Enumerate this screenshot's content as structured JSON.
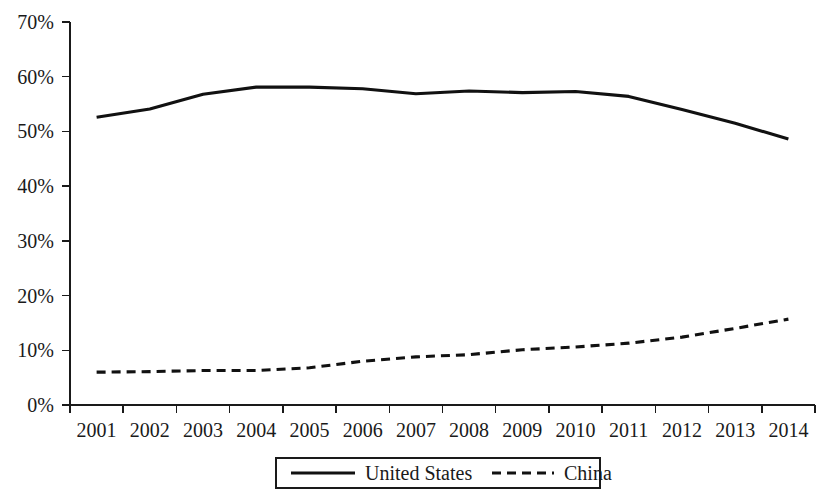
{
  "chart_data": {
    "type": "line",
    "title": "",
    "subtitle": "",
    "xlabel": "",
    "ylabel": "",
    "grid": false,
    "legend_position": "bottom",
    "x": [
      "2001",
      "2002",
      "2003",
      "2004",
      "2005",
      "2006",
      "2007",
      "2008",
      "2009",
      "2010",
      "2011",
      "2012",
      "2013",
      "2014"
    ],
    "categories": [
      "2001",
      "2002",
      "2003",
      "2004",
      "2005",
      "2006",
      "2007",
      "2008",
      "2009",
      "2010",
      "2011",
      "2012",
      "2013",
      "2014"
    ],
    "ylim": [
      0,
      70
    ],
    "y_ticks": [
      0,
      10,
      20,
      30,
      40,
      50,
      60,
      70
    ],
    "y_tick_labels": [
      "0%",
      "10%",
      "20%",
      "30%",
      "40%",
      "50%",
      "60%",
      "70%"
    ],
    "y_unit": "%",
    "series": [
      {
        "name": "United States",
        "style": "solid",
        "color": "#111111",
        "values": [
          52.6,
          54.1,
          56.8,
          58.1,
          58.1,
          57.8,
          56.9,
          57.4,
          57.1,
          57.3,
          56.4,
          54.0,
          51.5,
          48.6
        ]
      },
      {
        "name": "China",
        "style": "dashed",
        "color": "#111111",
        "values": [
          6.0,
          6.1,
          6.3,
          6.3,
          6.8,
          8.0,
          8.8,
          9.2,
          10.1,
          10.6,
          11.3,
          12.4,
          14.0,
          15.7
        ]
      }
    ]
  },
  "axes": {
    "y_tick_labels": [
      "70%",
      "60%",
      "50%",
      "40%",
      "30%",
      "20%",
      "10%",
      "0%"
    ],
    "x_tick_labels": [
      "2001",
      "2002",
      "2003",
      "2004",
      "2005",
      "2006",
      "2007",
      "2008",
      "2009",
      "2010",
      "2011",
      "2012",
      "2013",
      "2014"
    ]
  },
  "legend": {
    "items": [
      {
        "label": "United States",
        "style": "solid"
      },
      {
        "label": "China",
        "style": "dashed"
      }
    ]
  }
}
